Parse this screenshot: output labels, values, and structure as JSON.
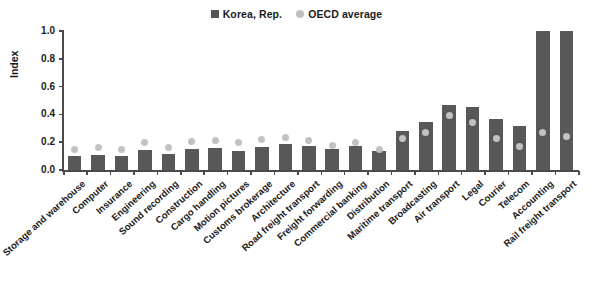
{
  "chart_data": {
    "type": "bar",
    "title": "",
    "xlabel": "",
    "ylabel": "Index",
    "ylim": [
      0.0,
      1.0
    ],
    "yticks": [
      "0.0",
      "0.2",
      "0.4",
      "0.6",
      "0.8",
      "1.0"
    ],
    "grid": false,
    "legend_position": "top-center",
    "categories": [
      "Storage and warehouse",
      "Computer",
      "Insurance",
      "Engineering",
      "Sound recording",
      "Construction",
      "Cargo handling",
      "Motion pictures",
      "Customs brokerage",
      "Architecture",
      "Road freight transport",
      "Freight forwarding",
      "Commercial banking",
      "Distribution",
      "Maritime transport",
      "Broadcasting",
      "Air transport",
      "Legal",
      "Courier",
      "Telecom",
      "Accounting",
      "Rail freight transport"
    ],
    "series": [
      {
        "name": "Korea, Rep.",
        "type": "bar",
        "color": "#585858",
        "values": [
          0.1,
          0.11,
          0.1,
          0.145,
          0.115,
          0.15,
          0.16,
          0.14,
          0.165,
          0.19,
          0.17,
          0.15,
          0.17,
          0.14,
          0.28,
          0.345,
          0.47,
          0.455,
          0.365,
          0.315,
          1.0,
          1.0
        ]
      },
      {
        "name": "OECD average",
        "type": "scatter",
        "color": "#c2c2c2",
        "values": [
          0.15,
          0.16,
          0.15,
          0.195,
          0.16,
          0.205,
          0.215,
          0.195,
          0.22,
          0.235,
          0.21,
          0.175,
          0.195,
          0.145,
          0.23,
          0.27,
          0.39,
          0.34,
          0.23,
          0.17,
          0.27,
          0.24
        ]
      }
    ]
  },
  "legend": {
    "items": [
      {
        "label": "Korea, Rep.",
        "marker": "square",
        "color": "#585858"
      },
      {
        "label": "OECD average",
        "marker": "circle",
        "color": "#c2c2c2"
      }
    ]
  },
  "axis": {
    "y_title": "Index"
  }
}
